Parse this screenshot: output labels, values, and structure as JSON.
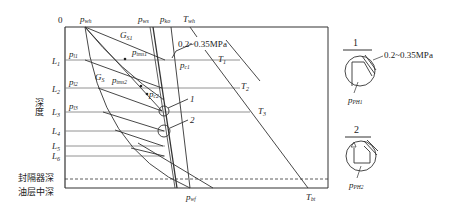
{
  "diagram": {
    "origin_label": "0",
    "top_labels": {
      "p_wh": "p",
      "p_wh_sub": "wh",
      "p_ws": "p",
      "p_ws_sub": "ws",
      "p_ko": "p",
      "p_ko_sub": "ko",
      "T_wh": "T",
      "T_wh_sub": "wh"
    },
    "depth_axis_label": "深度",
    "depth_levels": [
      {
        "label": "L",
        "sub": "1",
        "p": "p",
        "psub": "l1"
      },
      {
        "label": "L",
        "sub": "2",
        "p": "p",
        "psub": "l2"
      },
      {
        "label": "L",
        "sub": "3",
        "p": "p",
        "psub": "l3"
      },
      {
        "label": "L",
        "sub": "4"
      },
      {
        "label": "L",
        "sub": "5"
      },
      {
        "label": "L",
        "sub": "6"
      }
    ],
    "curve_labels": {
      "G_S1": "G",
      "G_S1_sub": "S1",
      "G_S": "G",
      "G_S_sub": "S",
      "p_tms1": "p",
      "p_tms1_sub": "tms1",
      "p_tms2": "p",
      "p_tms2_sub": "tms2",
      "p_c1": "p",
      "p_c1_sub": "c1",
      "p_c2": "p",
      "p_c2_sub": "c2",
      "T1": "T",
      "T1_sub": "1",
      "T2": "T",
      "T2_sub": "2",
      "T3": "T",
      "T3_sub": "3"
    },
    "pressure_note": "0.2~0.35MPa",
    "callouts": [
      "1",
      "2"
    ],
    "bottom_labels": {
      "packer_depth": "封隔器深",
      "reservoir_mid_depth": "油层中深",
      "p_wf": "p",
      "p_wf_sub": "wf",
      "T_bt": "T",
      "T_bt_sub": "bt"
    },
    "detail_panels": [
      {
        "title": "1",
        "note": "0.2~0.35MPa",
        "p": "p",
        "psub": "PH1"
      },
      {
        "title": "2",
        "p": "p",
        "psub": "PH2"
      }
    ]
  }
}
